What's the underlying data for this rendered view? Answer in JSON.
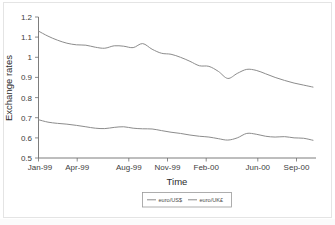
{
  "chart_data": {
    "type": "line",
    "title": "",
    "xlabel": "Time",
    "ylabel": "Exchange rates",
    "ylim": [
      0.5,
      1.2
    ],
    "ytick_labels": [
      "1.2",
      "1.1",
      "1",
      "0.9",
      "0.8",
      "0.7",
      "0.6",
      "0.5"
    ],
    "ytick_values": [
      1.2,
      1.1,
      1.0,
      0.9,
      0.8,
      0.7,
      0.6,
      0.5
    ],
    "xtick_labels": [
      "Jan-99",
      "Apr-99",
      "Aug-99",
      "Nov-99",
      "Feb-00",
      "Jun-00",
      "Sep-00"
    ],
    "xtick_indices": [
      0,
      3,
      7,
      10,
      13,
      17,
      20
    ],
    "grid": false,
    "legend_position": "bottom",
    "x": [
      "Jan-99",
      "Feb-99",
      "Mar-99",
      "Apr-99",
      "May-99",
      "Jun-99",
      "Jul-99",
      "Aug-99",
      "Sep-99",
      "Oct-99",
      "Nov-99",
      "Dec-99",
      "Jan-00",
      "Feb-00",
      "Mar-00",
      "Apr-00",
      "May-00",
      "Jun-00",
      "Jul-00",
      "Aug-00",
      "Sep-00",
      "Oct-00"
    ],
    "series": [
      {
        "name": "euro/US$",
        "color": "#8c8c8c",
        "values": [
          1.13,
          1.105,
          1.085,
          1.07,
          1.062,
          1.06,
          1.05,
          1.045,
          1.057,
          1.055,
          1.048,
          1.068,
          1.04,
          1.02,
          1.015,
          1.0,
          0.98,
          0.958,
          0.955,
          0.93,
          0.895,
          0.92
        ]
      },
      {
        "name": "euro/UK£",
        "color": "#8c8c8c",
        "values": [
          0.69,
          0.678,
          0.672,
          0.668,
          0.662,
          0.655,
          0.648,
          0.646,
          0.652,
          0.655,
          0.648,
          0.645,
          0.644,
          0.636,
          0.628,
          0.622,
          0.614,
          0.608,
          0.604,
          0.596,
          0.589,
          0.6
        ]
      }
    ],
    "series_extension": {
      "note": "values continue past Oct-00 tick to end of axis",
      "euro/US$": [
        0.94,
        0.935,
        0.918,
        0.9,
        0.885,
        0.872,
        0.862,
        0.852
      ],
      "euro/UK£": [
        0.622,
        0.618,
        0.608,
        0.604,
        0.606,
        0.6,
        0.598,
        0.588
      ]
    }
  },
  "legend": {
    "items": [
      {
        "label": "euro/US$"
      },
      {
        "label": "euro/UK£"
      }
    ]
  }
}
